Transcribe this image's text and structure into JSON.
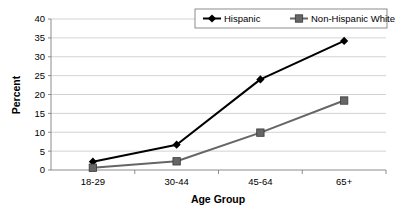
{
  "chart_data": {
    "type": "line",
    "title": "",
    "xlabel": "Age Group",
    "ylabel": "Percent",
    "categories": [
      "18-29",
      "30-44",
      "45-64",
      "65+"
    ],
    "ylim": [
      0,
      40
    ],
    "yticks": [
      0,
      5,
      10,
      15,
      20,
      25,
      30,
      35,
      40
    ],
    "ytick_labels": [
      "0",
      "5",
      "10",
      "15",
      "20",
      "25",
      "30",
      "35",
      "40"
    ],
    "grid": true,
    "legend_position": "top-right",
    "series": [
      {
        "name": "Hispanic",
        "values": [
          2.2,
          6.7,
          24.0,
          34.2
        ],
        "color": "#000000",
        "marker": "diamond"
      },
      {
        "name": "Non-Hispanic White",
        "values": [
          0.6,
          2.3,
          9.9,
          18.4
        ],
        "color": "#666666",
        "marker": "square"
      }
    ]
  },
  "colors": {
    "background": "#ffffff",
    "gridline": "#c8c8c8",
    "axis": "#808080",
    "series_hispanic": "#000000",
    "series_nhwhite": "#666666"
  }
}
